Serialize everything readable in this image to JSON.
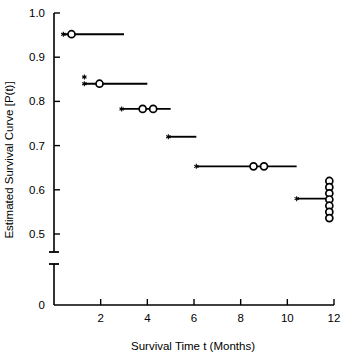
{
  "chart_data": {
    "type": "line",
    "subtype": "kaplan-meier-step",
    "title": "",
    "xlabel": "Survival Time t (Months)",
    "ylabel": "Estimated Survival Curve [P(t)]",
    "xlim": [
      0,
      12
    ],
    "ylim": [
      0.45,
      1.0
    ],
    "y_axis_break": true,
    "y_axis_break_between": [
      0,
      0.45
    ],
    "grid": false,
    "legend": null,
    "xticks": [
      0,
      2,
      4,
      6,
      8,
      10,
      12
    ],
    "xtick_labels": [
      "0",
      "2",
      "4",
      "6",
      "8",
      "10",
      "12"
    ],
    "yticks": [
      0.5,
      0.6,
      0.7,
      0.8,
      0.9,
      1.0
    ],
    "ytick_labels": [
      "0.5",
      "0.6",
      "0.7",
      "0.8",
      "0.9",
      "1.0"
    ],
    "y_zero_tick_label": "0",
    "steps": [
      {
        "survival": 0.952,
        "t_start": 0.4,
        "t_end": 3.0
      },
      {
        "survival": 0.84,
        "t_start": 1.3,
        "t_end": 4.0
      },
      {
        "survival": 0.783,
        "t_start": 2.9,
        "t_end": 5.0
      },
      {
        "survival": 0.72,
        "t_start": 4.9,
        "t_end": 6.1
      },
      {
        "survival": 0.653,
        "t_start": 6.1,
        "t_end": 10.4
      },
      {
        "survival": 0.58,
        "t_start": 10.4,
        "t_end": 11.8
      }
    ],
    "event_markers": [
      {
        "t": 0.75,
        "survival": 0.952
      },
      {
        "t": 1.95,
        "survival": 0.84
      },
      {
        "t": 3.8,
        "survival": 0.783
      },
      {
        "t": 4.25,
        "survival": 0.783
      },
      {
        "t": 8.55,
        "survival": 0.653
      },
      {
        "t": 9.0,
        "survival": 0.653
      },
      {
        "t": 11.8,
        "survival": 0.62
      },
      {
        "t": 11.8,
        "survival": 0.606
      },
      {
        "t": 11.8,
        "survival": 0.592
      },
      {
        "t": 11.8,
        "survival": 0.578
      },
      {
        "t": 11.8,
        "survival": 0.564
      },
      {
        "t": 11.8,
        "survival": 0.55
      },
      {
        "t": 11.8,
        "survival": 0.536
      }
    ],
    "censored_markers": [
      {
        "t": 0.4,
        "survival": 0.952
      },
      {
        "t": 1.3,
        "survival": 0.855
      },
      {
        "t": 1.3,
        "survival": 0.84
      },
      {
        "t": 2.9,
        "survival": 0.783
      },
      {
        "t": 4.9,
        "survival": 0.72
      },
      {
        "t": 6.1,
        "survival": 0.653
      },
      {
        "t": 10.4,
        "survival": 0.58
      }
    ],
    "marker_styles": {
      "event": "open-circle",
      "censored": "asterisk"
    },
    "colors": {
      "axis": "#000000",
      "line": "#000000",
      "marker": "#000000",
      "background": "#ffffff"
    }
  }
}
